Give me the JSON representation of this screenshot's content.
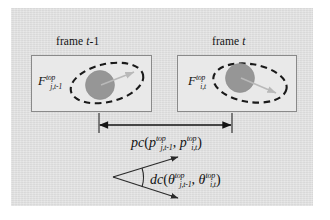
{
  "figure": {
    "panel_background": "#dedede",
    "box_background": "#e9e9e9",
    "box_border_color": "#8a8a8a",
    "blob_color": "#969696",
    "dashed_ellipse_color": "#1a1a1a",
    "arrow_color": "#141414",
    "inner_arrow_color": "#b9b9b9"
  },
  "frames": [
    {
      "title_prefix": "frame ",
      "title_var": "t",
      "title_suffix": "-1",
      "feature_base": "F",
      "feature_sup": "top",
      "feature_sub": "j,t-1"
    },
    {
      "title_prefix": "frame ",
      "title_var": "t",
      "title_suffix": "",
      "feature_base": "F",
      "feature_sup": "top",
      "feature_sub": "i,t"
    }
  ],
  "measures": {
    "position_cost": {
      "name": "pc",
      "open_paren": "(",
      "arg1_base": "p",
      "arg1_sup": "top",
      "arg1_sub": "j,t-1",
      "separator": ", ",
      "arg2_base": "p",
      "arg2_sup": "top",
      "arg2_sub": "i,t",
      "close_paren": ")"
    },
    "direction_cost": {
      "name": "dc",
      "open_paren": "(",
      "arg1_base": "θ",
      "arg1_sup": "top",
      "arg1_sub": "j,t-1",
      "separator": ", ",
      "arg2_base": "θ",
      "arg2_sup": "top",
      "arg2_sub": "i,t",
      "close_paren": ")"
    }
  }
}
